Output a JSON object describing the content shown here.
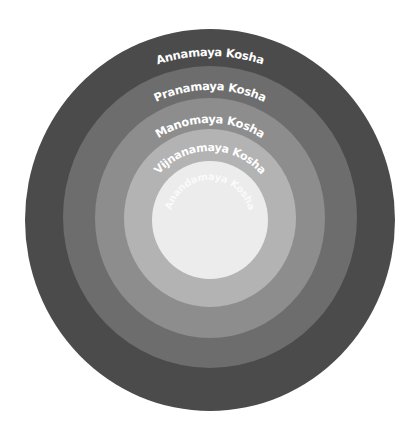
{
  "diagram": {
    "type": "concentric-circles",
    "center": [
      210,
      220
    ],
    "layers": [
      {
        "name": "Annamaya Kosha",
        "color": "#4b4b4b",
        "rx": 185,
        "ry": 191,
        "cy": 220,
        "label_radius": 164,
        "font_size": 11.5
      },
      {
        "name": "Pranamaya Kosha",
        "color": "#6d6d6d",
        "rx": 147,
        "ry": 151,
        "cy": 217,
        "label_radius": 127,
        "font_size": 11.5
      },
      {
        "name": "Manomaya Kosha",
        "color": "#8d8d8d",
        "rx": 115,
        "ry": 120,
        "cy": 218,
        "label_radius": 95,
        "font_size": 11.5
      },
      {
        "name": "Vijnanamaya Kosha",
        "color": "#b3b3b3",
        "rx": 86,
        "ry": 89,
        "cy": 218,
        "label_radius": 67,
        "font_size": 11.5
      },
      {
        "name": "Anandamaya Kosha",
        "color": "#ececec",
        "rx": 58,
        "ry": 59,
        "cy": 220,
        "label_radius": 40,
        "font_size": 10.5
      }
    ]
  }
}
